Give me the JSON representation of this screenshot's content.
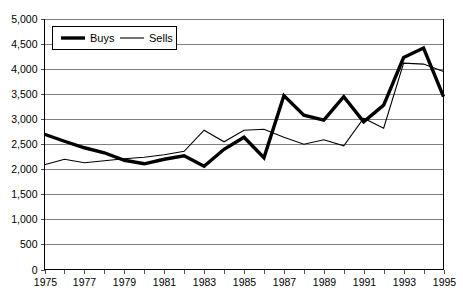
{
  "chart_data": {
    "type": "line",
    "title": "",
    "xlabel": "",
    "ylabel": "",
    "x": [
      1975,
      1976,
      1977,
      1978,
      1979,
      1980,
      1981,
      1982,
      1983,
      1984,
      1985,
      1986,
      1987,
      1988,
      1989,
      1990,
      1991,
      1992,
      1993,
      1994,
      1995
    ],
    "series": [
      {
        "name": "Buys",
        "style": "thick",
        "values": [
          2700,
          2560,
          2430,
          2330,
          2180,
          2110,
          2200,
          2270,
          2060,
          2400,
          2640,
          2230,
          3470,
          3080,
          2980,
          3450,
          2950,
          3280,
          4230,
          4420,
          3450
        ]
      },
      {
        "name": "Sells",
        "style": "thin",
        "values": [
          2090,
          2200,
          2130,
          2170,
          2210,
          2240,
          2290,
          2360,
          2780,
          2550,
          2780,
          2800,
          2640,
          2500,
          2590,
          2470,
          3020,
          2820,
          4120,
          4100,
          3950
        ]
      }
    ],
    "ylim": [
      0,
      5000
    ],
    "ytick_step": 500,
    "ytick_labels": [
      "0",
      "500",
      "1,000",
      "1,500",
      "2,000",
      "2,500",
      "3,000",
      "3,500",
      "4,000",
      "4,500",
      "5,000"
    ],
    "xlim": [
      1975,
      1995
    ],
    "xtick_step": 1,
    "xtick_label_step": 2,
    "xtick_labels": [
      "1975",
      "1977",
      "1979",
      "1981",
      "1983",
      "1985",
      "1987",
      "1989",
      "1991",
      "1993",
      "1995"
    ],
    "grid": "horizontal",
    "legend_position": "top-left",
    "colors": {
      "series": "#000000",
      "gridline": "#808080",
      "axis": "#000000",
      "background": "#ffffff"
    }
  },
  "legend": {
    "entries": [
      {
        "label": "Buys"
      },
      {
        "label": "Sells"
      }
    ]
  }
}
